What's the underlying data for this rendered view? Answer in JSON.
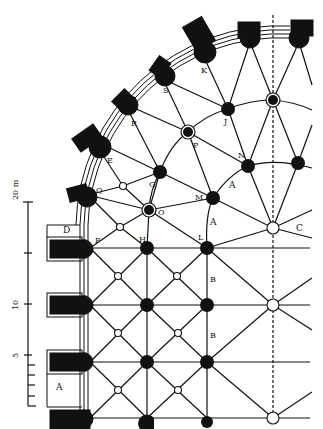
{
  "diagram": {
    "type": "architectural-plan",
    "colors": {
      "ink": "#111111",
      "paper": "#ffffff"
    },
    "scale_bar": {
      "unit_label": "20 m",
      "ticks": [
        {
          "label": "20 m",
          "value": 20
        },
        {
          "label": "",
          "value": 15
        },
        {
          "label": "10",
          "value": 10
        },
        {
          "label": "5",
          "value": 5
        },
        {
          "label": "",
          "value": 0
        }
      ]
    },
    "labels": {
      "A_left": "A",
      "D": "D",
      "F": "F",
      "H": "H",
      "L": "L",
      "B1": "B",
      "B2": "B",
      "C": "C",
      "A1": "A",
      "A2": "A",
      "Q": "Q",
      "O": "O",
      "G": "G",
      "M": "M",
      "E": "E",
      "R": "R",
      "P": "P",
      "N": "N",
      "S": "S",
      "J": "J",
      "K": "K"
    }
  }
}
